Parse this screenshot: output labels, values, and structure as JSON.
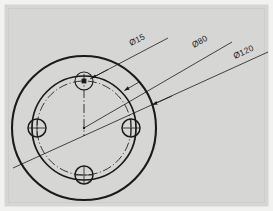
{
  "drawing": {
    "type": "engineering-drawing",
    "title": "Circular flange plate with four bolt holes",
    "sheet": {
      "background_color": "#d6d6d4",
      "frame_color": "#ececeb",
      "line_color": "#1a1a1a",
      "width": 273,
      "height": 211
    },
    "view": {
      "name": "front-view",
      "center": {
        "x": 84,
        "y": 128
      }
    },
    "circles": [
      {
        "name": "outer-circle",
        "label": "Ø120",
        "style": "continuous-thick",
        "cx": 84,
        "cy": 128,
        "r": 72
      },
      {
        "name": "inner-circle",
        "label": "",
        "style": "continuous-thick",
        "cx": 84,
        "cy": 128,
        "r": 52
      },
      {
        "name": "bolt-circle",
        "label": "Ø80",
        "style": "dash-dot-centerline",
        "cx": 84,
        "cy": 128,
        "r": 47
      }
    ],
    "holes": [
      {
        "name": "hole-top",
        "label": "Ø15",
        "cx": 84,
        "cy": 81,
        "r": 9
      },
      {
        "name": "hole-right",
        "label": "Ø15",
        "cx": 131,
        "cy": 128,
        "r": 9
      },
      {
        "name": "hole-bottom",
        "label": "Ø15",
        "cx": 84,
        "cy": 175,
        "r": 9
      },
      {
        "name": "hole-left",
        "label": "Ø15",
        "cx": 37,
        "cy": 128,
        "r": 9
      }
    ],
    "dimensions": [
      {
        "name": "dimension-hole-diameter",
        "text": "Ø15",
        "target": "hole-top",
        "leader_from": {
          "x": 168,
          "y": 38
        },
        "leader_to": {
          "x": 90,
          "y": 79
        },
        "text_x": 131,
        "text_y": 46,
        "angle": -27
      },
      {
        "name": "dimension-bolt-circle",
        "text": "Ø80",
        "target": "bolt-circle",
        "leader_from": {
          "x": 232,
          "y": 42
        },
        "leader_to": {
          "x": 84,
          "y": 128
        },
        "text_x": 194,
        "text_y": 48,
        "angle": -30
      },
      {
        "name": "dimension-outer-diameter",
        "text": "Ø120",
        "target": "outer-circle",
        "leader_from": {
          "x": 268,
          "y": 52
        },
        "leader_to": {
          "x": 13,
          "y": 168
        },
        "text_x": 235,
        "text_y": 59,
        "angle": -25
      }
    ],
    "centerlines": [
      {
        "name": "centerline-vertical",
        "x1": 84,
        "y1": 74,
        "x2": 84,
        "y2": 135
      }
    ],
    "annotations": {
      "diameter_symbol": "Ø",
      "values": [
        "15",
        "80",
        "120"
      ],
      "units": "mm"
    }
  }
}
